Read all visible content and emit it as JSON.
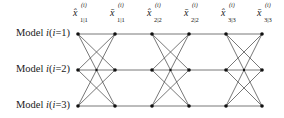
{
  "columns": [
    {
      "base": "x̂",
      "sup": "(i)",
      "sub": "1|1",
      "x": 78
    },
    {
      "base": "x̄",
      "sup": "(i)",
      "sub": "1|1",
      "x": 115
    },
    {
      "base": "x̂",
      "sup": "(i)",
      "sub": "2|2",
      "x": 152
    },
    {
      "base": "x̄",
      "sup": "(i)",
      "sub": "2|2",
      "x": 189
    },
    {
      "base": "x̂",
      "sup": "(i)",
      "sub": "3|3",
      "x": 226
    },
    {
      "base": "x̄",
      "sup": "(i)",
      "sub": "3|3",
      "x": 262
    }
  ],
  "rows": [
    {
      "prefix": "Model ",
      "var": "i",
      "cond": "(i=1)",
      "y": 34
    },
    {
      "prefix": "Model ",
      "var": "i",
      "cond": "(i=2)",
      "y": 70
    },
    {
      "prefix": "Model ",
      "var": "i",
      "cond": "(i=3)",
      "y": 106
    }
  ],
  "colors": {
    "line": "#555555",
    "node": "#111111"
  }
}
